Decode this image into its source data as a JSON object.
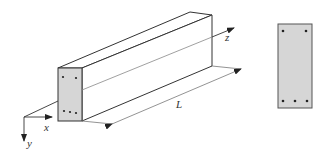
{
  "figure": {
    "colors": {
      "line": "#333333",
      "face_fill": "#d6d6d6",
      "dimension_line": "#777777",
      "rebar": "#222222"
    },
    "axes": {
      "x_label": "x",
      "y_label": "y",
      "z_label": "z"
    },
    "dimension": {
      "length_label": "L"
    },
    "beam_end_face": {
      "top_bars": 2,
      "bottom_bars": 3
    },
    "cross_section": {
      "top_bars": 2,
      "bottom_bars": 3
    }
  }
}
